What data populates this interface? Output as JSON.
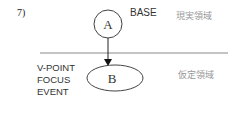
{
  "figure": {
    "number": "7)",
    "node_a": {
      "label": "A",
      "annotation": "BASE"
    },
    "node_b": {
      "label": "B",
      "annotations": [
        "V-POINT",
        "FOCUS",
        "EVENT"
      ]
    },
    "regions": {
      "upper": "現実領域",
      "lower": "仮定領域"
    }
  }
}
